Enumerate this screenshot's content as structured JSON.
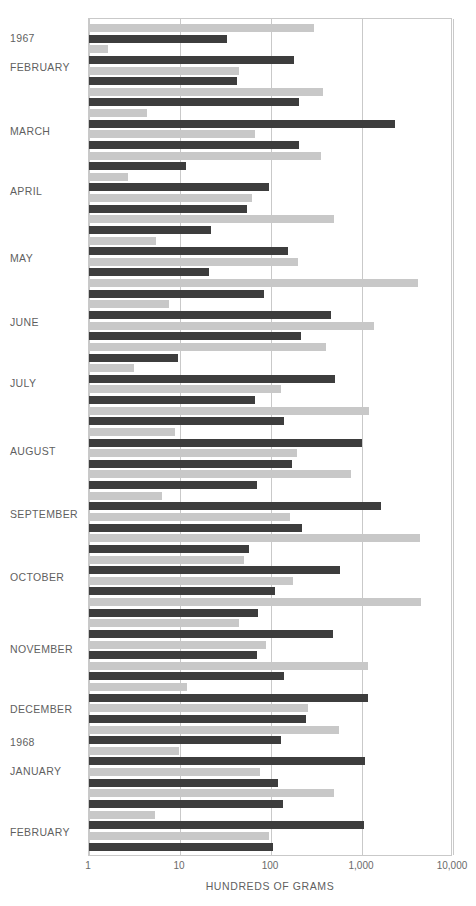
{
  "chart_data": {
    "type": "bar",
    "orientation": "horizontal",
    "title": "",
    "xlabel": "HUNDREDS OF GRAMS",
    "ylabel": "",
    "xscale": "log",
    "xlim": [
      1,
      10000
    ],
    "xticks": [
      1,
      10,
      100,
      1000,
      10000
    ],
    "xticklabels": [
      "1",
      "10",
      "100",
      "1,000",
      "10,000"
    ],
    "grid": true,
    "legend": "none",
    "series": [
      {
        "name": "light",
        "color": "#c8c8c8"
      },
      {
        "name": "dark",
        "color": "#3d3d3d"
      }
    ],
    "group_labels": [
      "1967",
      "FEBRUARY",
      "MARCH",
      "APRIL",
      "MAY",
      "JUNE",
      "JULY",
      "AUGUST",
      "SEPTEMBER",
      "OCTOBER",
      "NOVEMBER",
      "DECEMBER",
      "1968",
      "JANUARY",
      "FEBRUARY"
    ],
    "bars": [
      {
        "series": "light",
        "value": 300
      },
      {
        "series": "dark",
        "value": 33
      },
      {
        "series": "light",
        "value": 1.6
      },
      {
        "series": "dark",
        "value": 180
      },
      {
        "series": "light",
        "value": 44
      },
      {
        "series": "dark",
        "value": 42
      },
      {
        "series": "light",
        "value": 370
      },
      {
        "series": "dark",
        "value": 205
      },
      {
        "series": "light",
        "value": 4.3
      },
      {
        "series": "dark",
        "value": 2300
      },
      {
        "series": "light",
        "value": 67
      },
      {
        "series": "dark",
        "value": 205
      },
      {
        "series": "light",
        "value": 350
      },
      {
        "series": "dark",
        "value": 11.5
      },
      {
        "series": "light",
        "value": 2.7
      },
      {
        "series": "dark",
        "value": 95
      },
      {
        "series": "light",
        "value": 62
      },
      {
        "series": "dark",
        "value": 55
      },
      {
        "series": "light",
        "value": 490
      },
      {
        "series": "dark",
        "value": 22
      },
      {
        "series": "light",
        "value": 5.4
      },
      {
        "series": "dark",
        "value": 155
      },
      {
        "series": "light",
        "value": 200
      },
      {
        "series": "dark",
        "value": 21
      },
      {
        "series": "light",
        "value": 4100
      },
      {
        "series": "dark",
        "value": 83
      },
      {
        "series": "light",
        "value": 7.6
      },
      {
        "series": "dark",
        "value": 460
      },
      {
        "series": "light",
        "value": 1350
      },
      {
        "series": "dark",
        "value": 215
      },
      {
        "series": "light",
        "value": 400
      },
      {
        "series": "dark",
        "value": 9.6
      },
      {
        "series": "light",
        "value": 3.1
      },
      {
        "series": "dark",
        "value": 500
      },
      {
        "series": "light",
        "value": 130
      },
      {
        "series": "dark",
        "value": 66
      },
      {
        "series": "light",
        "value": 1200
      },
      {
        "series": "dark",
        "value": 140
      },
      {
        "series": "light",
        "value": 8.8
      },
      {
        "series": "dark",
        "value": 1000
      },
      {
        "series": "light",
        "value": 195
      },
      {
        "series": "dark",
        "value": 170
      },
      {
        "series": "light",
        "value": 760
      },
      {
        "series": "dark",
        "value": 70
      },
      {
        "series": "light",
        "value": 6.4
      },
      {
        "series": "dark",
        "value": 1600
      },
      {
        "series": "light",
        "value": 160
      },
      {
        "series": "dark",
        "value": 220
      },
      {
        "series": "light",
        "value": 4300
      },
      {
        "series": "dark",
        "value": 58
      },
      {
        "series": "light",
        "value": 50
      },
      {
        "series": "dark",
        "value": 580
      },
      {
        "series": "light",
        "value": 175
      },
      {
        "series": "dark",
        "value": 110
      },
      {
        "series": "light",
        "value": 4500
      },
      {
        "series": "dark",
        "value": 72
      },
      {
        "series": "light",
        "value": 44
      },
      {
        "series": "dark",
        "value": 480
      },
      {
        "series": "light",
        "value": 88
      },
      {
        "series": "dark",
        "value": 70
      },
      {
        "series": "light",
        "value": 1150
      },
      {
        "series": "dark",
        "value": 140
      },
      {
        "series": "light",
        "value": 12
      },
      {
        "series": "dark",
        "value": 1150
      },
      {
        "series": "light",
        "value": 255
      },
      {
        "series": "dark",
        "value": 240
      },
      {
        "series": "light",
        "value": 560
      },
      {
        "series": "dark",
        "value": 130
      },
      {
        "series": "light",
        "value": 9.8
      },
      {
        "series": "dark",
        "value": 1080
      },
      {
        "series": "light",
        "value": 76
      },
      {
        "series": "dark",
        "value": 120
      },
      {
        "series": "light",
        "value": 490
      },
      {
        "series": "dark",
        "value": 135
      },
      {
        "series": "light",
        "value": 5.3
      },
      {
        "series": "dark",
        "value": 1050
      },
      {
        "series": "light",
        "value": 94
      },
      {
        "series": "dark",
        "value": 105
      }
    ]
  },
  "axis": {
    "title": "HUNDREDS OF GRAMS",
    "ticks": [
      {
        "label": "1",
        "value": 1
      },
      {
        "label": "10",
        "value": 10
      },
      {
        "label": "100",
        "value": 100
      },
      {
        "label": "1,000",
        "value": 1000
      },
      {
        "label": "10,000",
        "value": 10000
      }
    ]
  },
  "row_labels": [
    {
      "text": "1967",
      "y": 33
    },
    {
      "text": "FEBRUARY",
      "y": 62
    },
    {
      "text": "MARCH",
      "y": 126
    },
    {
      "text": "APRIL",
      "y": 186
    },
    {
      "text": "MAY",
      "y": 253
    },
    {
      "text": "JUNE",
      "y": 317
    },
    {
      "text": "JULY",
      "y": 378
    },
    {
      "text": "AUGUST",
      "y": 446
    },
    {
      "text": "SEPTEMBER",
      "y": 509
    },
    {
      "text": "OCTOBER",
      "y": 572
    },
    {
      "text": "NOVEMBER",
      "y": 644
    },
    {
      "text": "DECEMBER",
      "y": 704
    },
    {
      "text": "1968",
      "y": 737
    },
    {
      "text": "JANUARY",
      "y": 766
    },
    {
      "text": "FEBRUARY",
      "y": 827
    }
  ],
  "colors": {
    "light_bar": "#c8c8c8",
    "dark_bar": "#3d3d3d",
    "grid": "#c9c9c9",
    "text": "#5f5f5f",
    "background": "#ffffff"
  }
}
